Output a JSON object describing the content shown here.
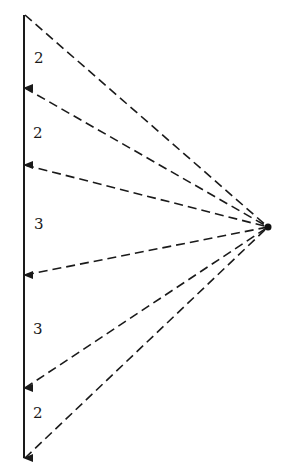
{
  "diagram": {
    "type": "force-polygon",
    "focal_point": {
      "x": 268,
      "y": 227
    },
    "line_x": 24,
    "nodes_y": [
      15,
      88,
      165,
      275,
      388,
      458
    ],
    "segments": [
      {
        "label": "2",
        "label_y": 58
      },
      {
        "label": "2",
        "label_y": 133
      },
      {
        "label": "3",
        "label_y": 224
      },
      {
        "label": "3",
        "label_y": 330
      },
      {
        "label": "2",
        "label_y": 414
      }
    ],
    "line_color": "#1a1a1a"
  }
}
